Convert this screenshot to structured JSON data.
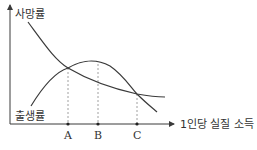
{
  "diagram": {
    "y_label": "사망률",
    "curve_label_bottom": "출생률",
    "x_label": "1인당 실질 소득",
    "points": [
      {
        "label": "A"
      },
      {
        "label": "B"
      },
      {
        "label": "C"
      }
    ],
    "curves": [
      {
        "name": "사망률",
        "shape": "decreasing"
      },
      {
        "name": "출생률",
        "shape": "inverted-U"
      }
    ],
    "colors": {
      "line": "#3a3a3a",
      "guide": "#888888"
    }
  }
}
